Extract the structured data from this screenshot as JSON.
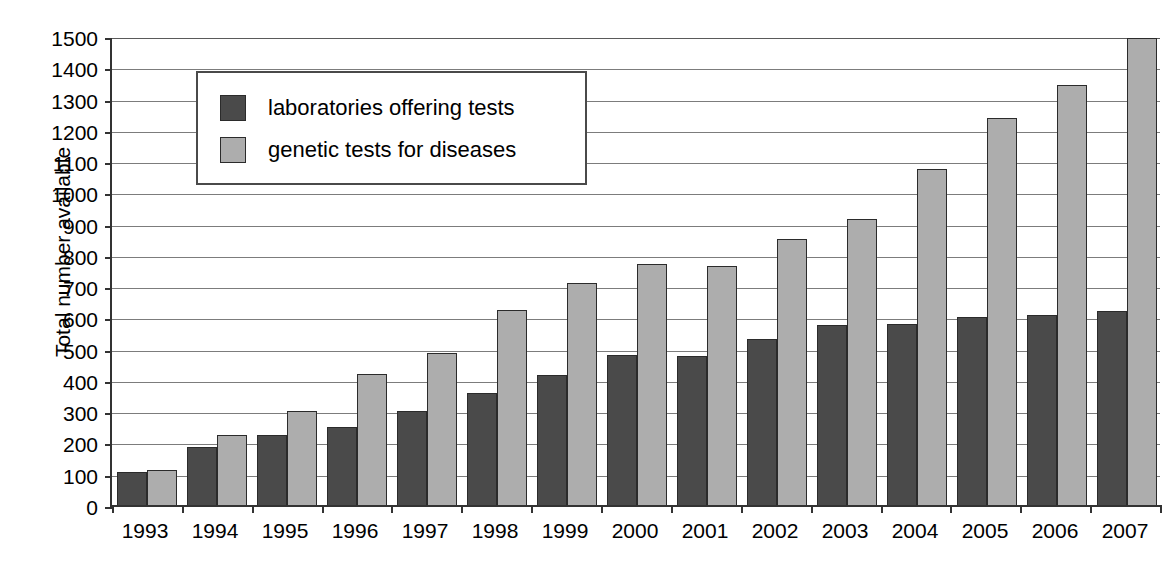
{
  "chart_data": {
    "type": "bar",
    "title": "",
    "xlabel": "",
    "ylabel": "Total number available",
    "ylim": [
      0,
      1500
    ],
    "ytick_step": 100,
    "grid": true,
    "legend_position": "upper-left-inside",
    "categories": [
      "1993",
      "1994",
      "1995",
      "1996",
      "1997",
      "1998",
      "1999",
      "2000",
      "2001",
      "2002",
      "2003",
      "2004",
      "2005",
      "2006",
      "2007"
    ],
    "yticks": [
      "1500",
      "1400",
      "1300",
      "1200",
      "1100",
      "1000",
      "900",
      "800",
      "700",
      "600",
      "500",
      "400",
      "300",
      "200",
      "100",
      "0"
    ],
    "series": [
      {
        "name": "laboratories offering tests",
        "color": "#4a4a4a",
        "values": [
          105,
          185,
          225,
          250,
          300,
          358,
          415,
          480,
          475,
          532,
          577,
          578,
          600,
          608,
          620
        ]
      },
      {
        "name": "genetic tests for diseases",
        "color": "#adadad",
        "values": [
          112,
          225,
          300,
          420,
          485,
          625,
          710,
          770,
          763,
          850,
          915,
          1075,
          1238,
          1342,
          1495
        ]
      }
    ]
  },
  "legend": {
    "items": [
      {
        "label": "laboratories offering tests",
        "swatch": "dark"
      },
      {
        "label": "genetic tests for diseases",
        "swatch": "light"
      }
    ]
  },
  "colors": {
    "series_dark": "#4a4a4a",
    "series_light": "#adadad",
    "axis": "#333333",
    "gridline": "#7c7c7c",
    "background": "#ffffff",
    "text": "#000000"
  }
}
